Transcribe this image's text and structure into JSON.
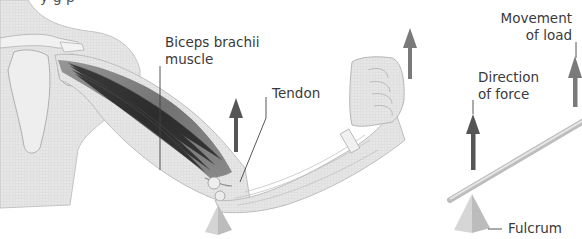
{
  "diagram": {
    "title_cut": "y        g        p",
    "colors": {
      "skin": "#e4e4e4",
      "skin_outline": "#b8b8b8",
      "bone": "#f0f0f0",
      "muscle_dark": "#6e6e6e",
      "arrow": "#555555",
      "arrow_light": "#7a7a7a",
      "fulcrum": "#c9c9c9",
      "lever": "#dcdcdc",
      "text": "#3a3a3a"
    },
    "labels": {
      "biceps_line1": "Biceps brachii",
      "biceps_line2": "muscle",
      "tendon": "Tendon",
      "movement_line1": "Movement",
      "movement_line2": "of load",
      "direction_line1": "Direction",
      "direction_line2": "of force",
      "fulcrum": "Fulcrum"
    }
  }
}
